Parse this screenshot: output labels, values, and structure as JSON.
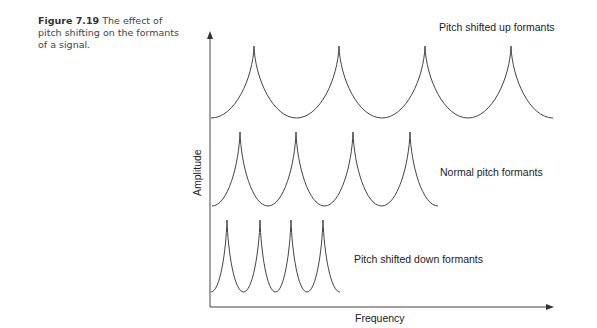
{
  "caption": {
    "figure_label": "Figure 7.19",
    "text": "The effect of pitch shifting on the formants of a signal."
  },
  "chart_data": {
    "type": "line",
    "title": "The effect of pitch shifting on the formants of a signal.",
    "xlabel": "Frequency",
    "ylabel": "Amplitude",
    "grid": false,
    "legend_position": "inline-right",
    "series": [
      {
        "name": "Pitch shifted up formants",
        "peaks": 4,
        "peak_x_px": [
          254,
          339,
          425,
          511
        ],
        "peak_y_px": 46,
        "base_y_px": 118,
        "x_start_px": 211,
        "x_end_px": 553
      },
      {
        "name": "Normal pitch formants",
        "peaks": 4,
        "peak_x_px": [
          240,
          296,
          353,
          410
        ],
        "peak_y_px": 132,
        "base_y_px": 206,
        "x_start_px": 212,
        "x_end_px": 438
      },
      {
        "name": "Pitch shifted down formants",
        "peaks": 4,
        "peak_x_px": [
          227,
          260,
          291,
          323
        ],
        "peak_y_px": 220,
        "base_y_px": 292,
        "x_start_px": 211,
        "x_end_px": 340
      }
    ],
    "annotations": [
      "Pitch shifted up formants",
      "Normal pitch formants",
      "Pitch shifted down formants"
    ]
  },
  "labels": {
    "up": "Pitch shifted up formants",
    "normal": "Normal pitch formants",
    "down": "Pitch shifted down formants",
    "x_axis": "Frequency",
    "y_axis": "Amplitude"
  },
  "colors": {
    "line": "#444444",
    "text": "#222222"
  }
}
